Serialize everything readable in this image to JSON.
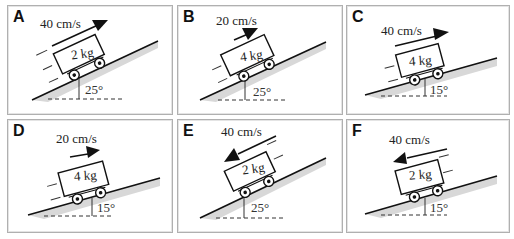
{
  "header": {
    "cut_off_text": "…each cart is moving at the instant shown (speed and mass given)…"
  },
  "panels": [
    {
      "letter": "A",
      "speed": "40 cm/s",
      "mass": "2 kg",
      "angle": "25°",
      "angle_deg": 25,
      "direction": "up-slope"
    },
    {
      "letter": "B",
      "speed": "20 cm/s",
      "mass": "4 kg",
      "angle": "25°",
      "angle_deg": 25,
      "direction": "up-slope"
    },
    {
      "letter": "C",
      "speed": "40 cm/s",
      "mass": "4 kg",
      "angle": "15°",
      "angle_deg": 15,
      "direction": "up-slope"
    },
    {
      "letter": "D",
      "speed": "20 cm/s",
      "mass": "4 kg",
      "angle": "15°",
      "angle_deg": 15,
      "direction": "up-slope"
    },
    {
      "letter": "E",
      "speed": "40 cm/s",
      "mass": "2 kg",
      "angle": "25°",
      "angle_deg": 25,
      "direction": "down-slope"
    },
    {
      "letter": "F",
      "speed": "40 cm/s",
      "mass": "2 kg",
      "angle": "15°",
      "angle_deg": 15,
      "direction": "down-slope"
    }
  ],
  "colors": {
    "border": "#b0b0b0",
    "line": "#111111",
    "shadow": "#d4d4d4",
    "text": "#222222"
  }
}
